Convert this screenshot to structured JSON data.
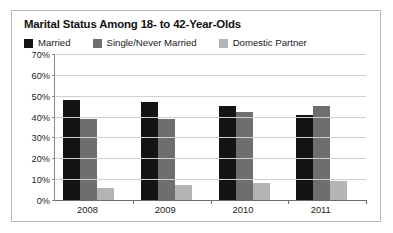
{
  "chart_data": {
    "type": "bar",
    "title": "Marital Status Among 18- to 42-Year-Olds",
    "xlabel": "",
    "ylabel": "",
    "categories": [
      "2008",
      "2009",
      "2010",
      "2011"
    ],
    "series": [
      {
        "name": "Married",
        "color": "#141414",
        "values": [
          48,
          47,
          45,
          41
        ]
      },
      {
        "name": "Single/Never Married",
        "color": "#6e6e6e",
        "values": [
          39,
          39,
          42,
          45
        ]
      },
      {
        "name": "Domestic Partner",
        "color": "#b4b4b4",
        "values": [
          6,
          7,
          8,
          9
        ]
      }
    ],
    "ylim": [
      0,
      70
    ],
    "y_tick_step": 10,
    "y_tick_labels": [
      "0%",
      "10%",
      "20%",
      "30%",
      "40%",
      "50%",
      "60%",
      "70%"
    ],
    "grid": true,
    "legend_position": "top-left",
    "value_suffix": "%"
  },
  "frame": {
    "border_color": "#b9b9b9",
    "background": "#ffffff"
  }
}
